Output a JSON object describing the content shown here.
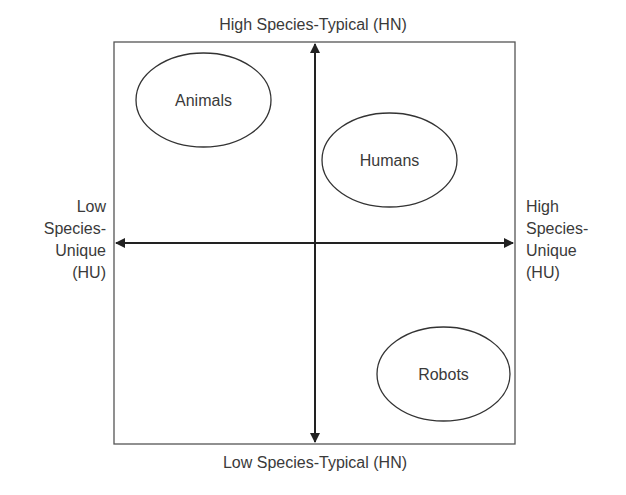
{
  "diagram": {
    "axes": {
      "top_label": "High Species-Typical (HN)",
      "bottom_label": "Low Species-Typical (HN)",
      "left_label": [
        "Low",
        "Species-",
        "Unique",
        "(HU)"
      ],
      "right_label": [
        "High",
        "Species-",
        "Unique",
        "(HU)"
      ]
    },
    "nodes": [
      {
        "label": "Animals",
        "quadrant": "top-left"
      },
      {
        "label": "Humans",
        "quadrant": "top-right"
      },
      {
        "label": "Robots",
        "quadrant": "bottom-right"
      }
    ],
    "colors": {
      "stroke": "#3a3a3a",
      "text": "#3a3a3a",
      "background": "#ffffff"
    }
  }
}
